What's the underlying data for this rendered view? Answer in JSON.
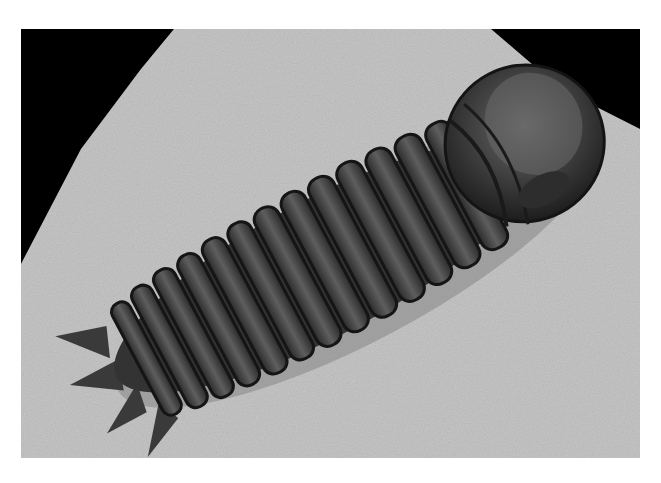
{
  "image": {
    "subject": "Trilobite fossil on rock matrix",
    "alt": "Black-and-white photograph of a segmented trilobite fossil lying diagonally on a pale speckled stone slab against a black background",
    "colors": {
      "background_page": "#ffffff",
      "backdrop": "#000000",
      "rock": "#c9c9c9",
      "rock_dark": "#9a9a9a",
      "fossil_dark": "#2a2a2a",
      "fossil_mid": "#4a4a4a",
      "fossil_light": "#6e6e6e"
    }
  }
}
